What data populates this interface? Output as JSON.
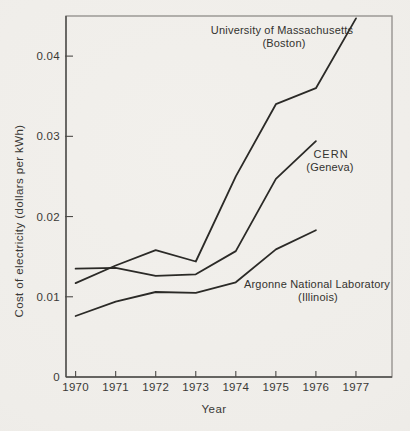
{
  "page": {
    "background_color": "#f0eeea"
  },
  "colors": {
    "ink": "#2b2a27",
    "frame": "#8f8d89",
    "axis": "#4c4b48",
    "text": "#3a3936"
  },
  "chart_data": {
    "type": "line",
    "title": "",
    "xlabel": "Year",
    "ylabel": "Cost of electricity (dollars per kWh)",
    "xlim": [
      1969.76,
      1977.9
    ],
    "ylim": [
      0,
      0.045
    ],
    "grid": false,
    "legend_position": "inline-annotations",
    "x_ticks": [
      1970,
      1971,
      1972,
      1973,
      1974,
      1975,
      1976,
      1977
    ],
    "y_ticks": [
      {
        "value": 0,
        "label": "0"
      },
      {
        "value": 0.01,
        "label": "0.01"
      },
      {
        "value": 0.02,
        "label": "0.02"
      },
      {
        "value": 0.03,
        "label": "0.03"
      },
      {
        "value": 0.04,
        "label": "0.04"
      }
    ],
    "series": [
      {
        "id": "umass",
        "name": "University of Massachusetts (Boston)",
        "label_lines": [
          "University of Massachusetts",
          "(Boston)"
        ],
        "label_anchor": {
          "x": 282,
          "y": 34,
          "line_height": 13
        },
        "x": [
          1970,
          1971,
          1972,
          1973,
          1974,
          1975,
          1976,
          1977
        ],
        "values": [
          0.0117,
          0.0139,
          0.0158,
          0.0144,
          0.025,
          0.034,
          0.036,
          0.0447
        ]
      },
      {
        "id": "cern",
        "name": "CERN (Geneva)",
        "label_lines": [
          "CERN",
          "(Geneva)"
        ],
        "label_anchor": {
          "x": 330,
          "y": 158,
          "line_height": 13
        },
        "x": [
          1970,
          1971,
          1972,
          1973,
          1974,
          1975,
          1976
        ],
        "values": [
          0.0135,
          0.0136,
          0.0126,
          0.0128,
          0.0157,
          0.0247,
          0.0294
        ]
      },
      {
        "id": "argonne",
        "name": "Argonne National Laboratory (Illinois)",
        "label_lines": [
          "Argonne National Laboratory",
          "(Illinois)"
        ],
        "label_anchor": {
          "x": 317,
          "y": 288,
          "line_height": 13
        },
        "x": [
          1970,
          1971,
          1972,
          1973,
          1974,
          1975,
          1976
        ],
        "values": [
          0.0076,
          0.0094,
          0.0106,
          0.0105,
          0.0118,
          0.0159,
          0.0183
        ]
      }
    ]
  }
}
